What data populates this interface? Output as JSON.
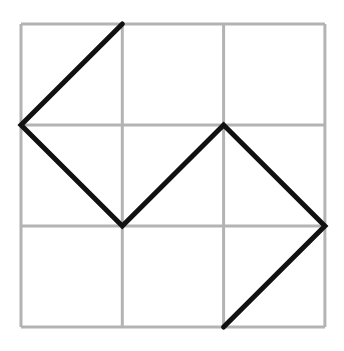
{
  "diagram": {
    "type": "grid-path",
    "grid": {
      "rows": 3,
      "cols": 3,
      "origin": [
        21,
        24
      ],
      "cell_size": [
        101.3,
        101
      ],
      "line_color": "#b3b3b3",
      "line_width": 3
    },
    "path": {
      "color": "#111111",
      "width": 5,
      "points_grid": [
        [
          1,
          0
        ],
        [
          0,
          1
        ],
        [
          1,
          2
        ],
        [
          2,
          1
        ],
        [
          3,
          2
        ],
        [
          2,
          3
        ]
      ]
    }
  }
}
